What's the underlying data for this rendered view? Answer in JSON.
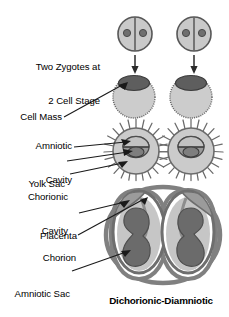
{
  "diagram": {
    "title": "Dichorionic-Diamniotic",
    "topic": "twin placentation development",
    "colors": {
      "outline": "#4d4d4d",
      "cell_light": "#c9c9c9",
      "cell_mid": "#a8a8a8",
      "cell_dark": "#636363",
      "nucleus": "#7a7a7a",
      "membrane": "#808080",
      "fluid": "#c4c4c4",
      "fetus": "#6e6e6e",
      "background": "#ffffff",
      "text": "#000000"
    },
    "labels": [
      {
        "id": "two-zygotes",
        "text_line1": "Two Zygotes at",
        "text_line2": "2 Cell Stage",
        "align": "right",
        "has_leader": false
      },
      {
        "id": "cell-mass",
        "text_line1": "Cell Mass",
        "text_line2": "",
        "align": "right",
        "has_leader": true
      },
      {
        "id": "amniotic-cavity",
        "text_line1": "Amniotic",
        "text_line2": "Cavity",
        "align": "right",
        "has_leader": true
      },
      {
        "id": "yolk-sac",
        "text_line1": "Yolk Sac",
        "text_line2": "",
        "align": "right",
        "has_leader": true
      },
      {
        "id": "chorionic-cavity",
        "text_line1": "Chorionic",
        "text_line2": "Cavity",
        "align": "right",
        "has_leader": true
      },
      {
        "id": "placenta",
        "text_line1": "Placenta",
        "text_line2": "",
        "align": "right",
        "has_leader": true
      },
      {
        "id": "chorion",
        "text_line1": "Chorion",
        "text_line2": "",
        "align": "right",
        "has_leader": true
      },
      {
        "id": "amniotic-sac",
        "text_line1": "Amniotic Sac",
        "text_line2": "",
        "align": "right",
        "has_leader": true
      }
    ],
    "stages": [
      {
        "id": "stage-zygote",
        "name": "zygote-2-cell",
        "count": 2,
        "nuclei_per_cell": 2
      },
      {
        "id": "stage-blastocyst",
        "name": "blastocyst-with-cell-mass",
        "count": 2
      },
      {
        "id": "stage-bilaminar",
        "name": "bilaminar-disc-with-villi",
        "count": 2
      },
      {
        "id": "stage-twins",
        "name": "dichorionic-diamniotic-twins",
        "count": 2
      }
    ]
  }
}
